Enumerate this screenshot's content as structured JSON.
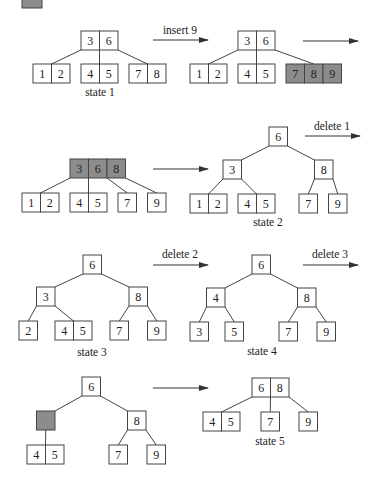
{
  "diagram": {
    "colors": {
      "node_fill": "#ffffff",
      "highlight_fill": "#8c8c8c",
      "stroke": "#444444",
      "text": "#222222"
    },
    "cell_width": 18.5,
    "cell_height": 19,
    "legend_swatch": {
      "x": 22,
      "y": -11,
      "w": 20,
      "h": 19,
      "fill": "#8c8c8c"
    },
    "transitions": [
      {
        "id": "insert-9",
        "label": "insert 9",
        "x1": 153,
        "x2": 208,
        "y": 40,
        "label_x": 180,
        "label_y": 34
      },
      {
        "id": "split-continue",
        "label": "",
        "x1": 303,
        "x2": 358,
        "y": 41,
        "label_x": 330,
        "label_y": 35
      },
      {
        "id": "split-result",
        "label": "",
        "x1": 153,
        "x2": 208,
        "y": 169,
        "label_x": 180,
        "label_y": 163
      },
      {
        "id": "delete-1",
        "label": "delete 1",
        "x1": 305,
        "x2": 360,
        "y": 136,
        "label_x": 332,
        "label_y": 130
      },
      {
        "id": "delete-2",
        "label": "delete 2",
        "x1": 153,
        "x2": 208,
        "y": 265,
        "label_x": 180,
        "label_y": 258
      },
      {
        "id": "delete-3",
        "label": "delete 3",
        "x1": 303,
        "x2": 358,
        "y": 265,
        "label_x": 330,
        "label_y": 258
      },
      {
        "id": "merge-result",
        "label": "",
        "x1": 153,
        "x2": 208,
        "y": 388,
        "label_x": 180,
        "label_y": 382
      }
    ],
    "trees": [
      {
        "id": "state-1",
        "label": "state 1",
        "label_x": 100,
        "label_y": 96,
        "nodes": [
          {
            "id": "root",
            "x": 81,
            "y": 31,
            "keys": [
              "3",
              "6"
            ],
            "highlight": false
          },
          {
            "id": "l0",
            "x": 33,
            "y": 64,
            "keys": [
              "1",
              "2"
            ],
            "highlight": false
          },
          {
            "id": "l1",
            "x": 81,
            "y": 64,
            "keys": [
              "4",
              "5"
            ],
            "highlight": false
          },
          {
            "id": "l2",
            "x": 129,
            "y": 64,
            "keys": [
              "7",
              "8"
            ],
            "highlight": false
          }
        ],
        "edges": [
          {
            "x1": 81,
            "y1": 50,
            "x2": 51.5,
            "y2": 64
          },
          {
            "x1": 99.5,
            "y1": 50,
            "x2": 99.5,
            "y2": 64
          },
          {
            "x1": 118,
            "y1": 50,
            "x2": 147.5,
            "y2": 64
          }
        ]
      },
      {
        "id": "after-insert-9",
        "label": "",
        "label_x": 0,
        "label_y": 0,
        "nodes": [
          {
            "id": "root",
            "x": 238,
            "y": 31,
            "keys": [
              "3",
              "6"
            ],
            "highlight": false
          },
          {
            "id": "l0",
            "x": 190,
            "y": 64,
            "keys": [
              "1",
              "2"
            ],
            "highlight": false
          },
          {
            "id": "l1",
            "x": 238,
            "y": 64,
            "keys": [
              "4",
              "5"
            ],
            "highlight": false
          },
          {
            "id": "l2",
            "x": 286,
            "y": 64,
            "keys": [
              "7",
              "8",
              "9"
            ],
            "highlight": true
          }
        ],
        "edges": [
          {
            "x1": 238,
            "y1": 50,
            "x2": 208.5,
            "y2": 64
          },
          {
            "x1": 256.5,
            "y1": 50,
            "x2": 256.5,
            "y2": 64
          },
          {
            "x1": 275,
            "y1": 50,
            "x2": 313.75,
            "y2": 64
          }
        ]
      },
      {
        "id": "overflow-root",
        "label": "",
        "label_x": 0,
        "label_y": 0,
        "nodes": [
          {
            "id": "root",
            "x": 70,
            "y": 159,
            "keys": [
              "3",
              "6",
              "8"
            ],
            "highlight": true
          },
          {
            "id": "l0",
            "x": 22,
            "y": 193,
            "keys": [
              "1",
              "2"
            ],
            "highlight": false
          },
          {
            "id": "l1",
            "x": 70,
            "y": 193,
            "keys": [
              "4",
              "5"
            ],
            "highlight": false
          },
          {
            "id": "l2",
            "x": 118,
            "y": 193,
            "keys": [
              "7"
            ],
            "highlight": false
          },
          {
            "id": "l3",
            "x": 147.5,
            "y": 193,
            "keys": [
              "9"
            ],
            "highlight": false
          }
        ],
        "edges": [
          {
            "x1": 70,
            "y1": 178,
            "x2": 40.5,
            "y2": 193
          },
          {
            "x1": 88.5,
            "y1": 178,
            "x2": 88.5,
            "y2": 193
          },
          {
            "x1": 107,
            "y1": 178,
            "x2": 127.25,
            "y2": 193
          },
          {
            "x1": 125.5,
            "y1": 178,
            "x2": 156.75,
            "y2": 193
          }
        ]
      },
      {
        "id": "state-2",
        "label": "state 2",
        "label_x": 268,
        "label_y": 226,
        "nodes": [
          {
            "id": "root",
            "x": 269,
            "y": 127,
            "keys": [
              "6"
            ],
            "highlight": false
          },
          {
            "id": "i0",
            "x": 223,
            "y": 160,
            "keys": [
              "3"
            ],
            "highlight": false
          },
          {
            "id": "i1",
            "x": 314.5,
            "y": 160,
            "keys": [
              "8"
            ],
            "highlight": false
          },
          {
            "id": "l0",
            "x": 190,
            "y": 194,
            "keys": [
              "1",
              "2"
            ],
            "highlight": false
          },
          {
            "id": "l1",
            "x": 238,
            "y": 194,
            "keys": [
              "4",
              "5"
            ],
            "highlight": false
          },
          {
            "id": "l2",
            "x": 299,
            "y": 194,
            "keys": [
              "7"
            ],
            "highlight": false
          },
          {
            "id": "l3",
            "x": 328.5,
            "y": 194,
            "keys": [
              "9"
            ],
            "highlight": false
          }
        ],
        "edges": [
          {
            "x1": 269,
            "y1": 146,
            "x2": 241.5,
            "y2": 160
          },
          {
            "x1": 287.5,
            "y1": 146,
            "x2": 314.5,
            "y2": 160
          },
          {
            "x1": 223,
            "y1": 179,
            "x2": 208.5,
            "y2": 194
          },
          {
            "x1": 241.5,
            "y1": 179,
            "x2": 256.5,
            "y2": 194
          },
          {
            "x1": 314.5,
            "y1": 179,
            "x2": 308.25,
            "y2": 194
          },
          {
            "x1": 333,
            "y1": 179,
            "x2": 337.75,
            "y2": 194
          }
        ]
      },
      {
        "id": "state-3",
        "label": "state 3",
        "label_x": 92,
        "label_y": 356,
        "nodes": [
          {
            "id": "root",
            "x": 83,
            "y": 255,
            "keys": [
              "6"
            ],
            "highlight": false
          },
          {
            "id": "i0",
            "x": 36.5,
            "y": 287,
            "keys": [
              "3"
            ],
            "highlight": false
          },
          {
            "id": "i1",
            "x": 129,
            "y": 287,
            "keys": [
              "8"
            ],
            "highlight": false
          },
          {
            "id": "l0",
            "x": 19,
            "y": 321,
            "keys": [
              "2"
            ],
            "highlight": false
          },
          {
            "id": "l1",
            "x": 55,
            "y": 321,
            "keys": [
              "4",
              "5"
            ],
            "highlight": false
          },
          {
            "id": "l2",
            "x": 110,
            "y": 321,
            "keys": [
              "7"
            ],
            "highlight": false
          },
          {
            "id": "l3",
            "x": 147.5,
            "y": 321,
            "keys": [
              "9"
            ],
            "highlight": false
          }
        ],
        "edges": [
          {
            "x1": 83,
            "y1": 274,
            "x2": 55,
            "y2": 287
          },
          {
            "x1": 101.5,
            "y1": 274,
            "x2": 129,
            "y2": 287
          },
          {
            "x1": 36.5,
            "y1": 306,
            "x2": 28.25,
            "y2": 321
          },
          {
            "x1": 55,
            "y1": 306,
            "x2": 73.5,
            "y2": 321
          },
          {
            "x1": 129,
            "y1": 306,
            "x2": 119.25,
            "y2": 321
          },
          {
            "x1": 147.5,
            "y1": 306,
            "x2": 156.75,
            "y2": 321
          }
        ]
      },
      {
        "id": "state-4",
        "label": "state 4",
        "label_x": 262,
        "label_y": 355,
        "nodes": [
          {
            "id": "root",
            "x": 252,
            "y": 255,
            "keys": [
              "6"
            ],
            "highlight": false
          },
          {
            "id": "i0",
            "x": 206.5,
            "y": 288,
            "keys": [
              "4"
            ],
            "highlight": false
          },
          {
            "id": "i1",
            "x": 297.5,
            "y": 288,
            "keys": [
              "8"
            ],
            "highlight": false
          },
          {
            "id": "l0",
            "x": 190,
            "y": 322,
            "keys": [
              "3"
            ],
            "highlight": false
          },
          {
            "id": "l1",
            "x": 225,
            "y": 322,
            "keys": [
              "5"
            ],
            "highlight": false
          },
          {
            "id": "l2",
            "x": 279,
            "y": 322,
            "keys": [
              "7"
            ],
            "highlight": false
          },
          {
            "id": "l3",
            "x": 317,
            "y": 322,
            "keys": [
              "9"
            ],
            "highlight": false
          }
        ],
        "edges": [
          {
            "x1": 252,
            "y1": 274,
            "x2": 225,
            "y2": 288
          },
          {
            "x1": 270.5,
            "y1": 274,
            "x2": 297.5,
            "y2": 288
          },
          {
            "x1": 206.5,
            "y1": 307,
            "x2": 199.25,
            "y2": 322
          },
          {
            "x1": 225,
            "y1": 307,
            "x2": 234.25,
            "y2": 322
          },
          {
            "x1": 297.5,
            "y1": 307,
            "x2": 288.25,
            "y2": 322
          },
          {
            "x1": 316,
            "y1": 307,
            "x2": 326.25,
            "y2": 322
          }
        ]
      },
      {
        "id": "underflow",
        "label": "",
        "label_x": 0,
        "label_y": 0,
        "nodes": [
          {
            "id": "root",
            "x": 82,
            "y": 377,
            "keys": [
              "6"
            ],
            "highlight": false
          },
          {
            "id": "i0",
            "x": 36.5,
            "y": 411,
            "keys": [
              ""
            ],
            "highlight": true
          },
          {
            "id": "i1",
            "x": 127.5,
            "y": 411,
            "keys": [
              "8"
            ],
            "highlight": false
          },
          {
            "id": "l0",
            "x": 27,
            "y": 445,
            "keys": [
              "4",
              "5"
            ],
            "highlight": false
          },
          {
            "id": "l1",
            "x": 109,
            "y": 445,
            "keys": [
              "7"
            ],
            "highlight": false
          },
          {
            "id": "l2",
            "x": 147,
            "y": 445,
            "keys": [
              "9"
            ],
            "highlight": false
          }
        ],
        "edges": [
          {
            "x1": 82,
            "y1": 396,
            "x2": 55,
            "y2": 411
          },
          {
            "x1": 100.5,
            "y1": 396,
            "x2": 127.5,
            "y2": 411
          },
          {
            "x1": 45.75,
            "y1": 430,
            "x2": 45.5,
            "y2": 445
          },
          {
            "x1": 127.5,
            "y1": 430,
            "x2": 118.25,
            "y2": 445
          },
          {
            "x1": 146,
            "y1": 430,
            "x2": 156.25,
            "y2": 445
          }
        ]
      },
      {
        "id": "state-5",
        "label": "state 5",
        "label_x": 270,
        "label_y": 445,
        "nodes": [
          {
            "id": "root",
            "x": 252,
            "y": 378,
            "keys": [
              "6",
              "8"
            ],
            "highlight": false
          },
          {
            "id": "l0",
            "x": 203,
            "y": 412,
            "keys": [
              "4",
              "5"
            ],
            "highlight": false
          },
          {
            "id": "l1",
            "x": 261,
            "y": 412,
            "keys": [
              "7"
            ],
            "highlight": false
          },
          {
            "id": "l2",
            "x": 299,
            "y": 412,
            "keys": [
              "9"
            ],
            "highlight": false
          }
        ],
        "edges": [
          {
            "x1": 252,
            "y1": 397,
            "x2": 221.5,
            "y2": 412
          },
          {
            "x1": 270.5,
            "y1": 397,
            "x2": 270.25,
            "y2": 412
          },
          {
            "x1": 289,
            "y1": 397,
            "x2": 308.25,
            "y2": 412
          }
        ]
      }
    ]
  }
}
